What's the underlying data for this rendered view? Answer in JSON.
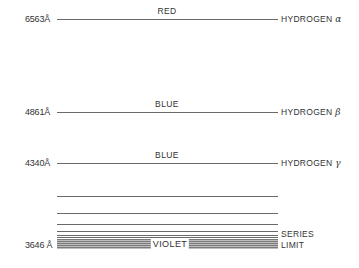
{
  "diagram": {
    "lines": [
      {
        "wavelength": "6563Å",
        "color": "RED",
        "label": "HYDROGEN",
        "greek": "α"
      },
      {
        "wavelength": "4861Å",
        "color": "BLUE",
        "label": "HYDROGEN",
        "greek": "β"
      },
      {
        "wavelength": "4340Å",
        "color": "BLUE",
        "label": "HYDROGEN",
        "greek": "γ"
      }
    ],
    "limit": {
      "wavelength": "3646 Å",
      "color": "VIOLET",
      "label_line1": "SERIES",
      "label_line2": "LIMIT"
    }
  }
}
